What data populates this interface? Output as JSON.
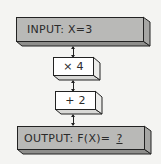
{
  "diagram": {
    "type": "flowchart",
    "input_box": {
      "label": "INPUT: X=3"
    },
    "steps": [
      {
        "label": "× 4"
      },
      {
        "label": "+ 2"
      }
    ],
    "output_box": {
      "label_prefix": "OUTPUT: F(X)=",
      "unknown": "?"
    }
  },
  "colors": {
    "background": "#f4f4f2",
    "io_box_fill": "#b9b9b7",
    "step_box_fill": "#ffffff",
    "stroke": "#222222"
  }
}
